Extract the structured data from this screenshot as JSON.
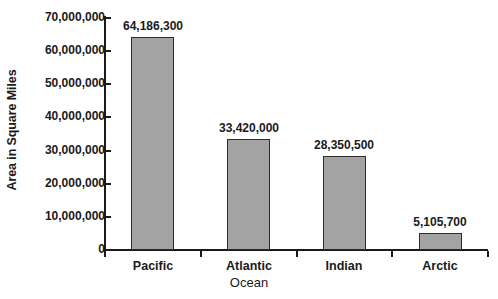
{
  "chart_data": {
    "type": "bar",
    "title": "",
    "xlabel": "Ocean",
    "ylabel": "Area in Square Miles",
    "categories": [
      "Pacific",
      "Atlantic",
      "Indian",
      "Arctic"
    ],
    "values": [
      64186300,
      33420000,
      28350500,
      5105700
    ],
    "value_labels": [
      "64,186,300",
      "33,420,000",
      "28,350,500",
      "5,105,700"
    ],
    "ylim": [
      0,
      70000000
    ],
    "ytick_values": [
      0,
      10000000,
      20000000,
      30000000,
      40000000,
      50000000,
      60000000,
      70000000
    ],
    "ytick_labels": [
      "0",
      "10,000,000",
      "20,000,000",
      "30,000,000",
      "40,000,000",
      "50,000,000",
      "60,000,000",
      "70,000,000"
    ],
    "grid": false,
    "legend": null,
    "bar_color": "#a3a3a3",
    "bar_border_color": "#2b2b2b",
    "axis_color": "#1a1a1a",
    "background": "#ffffff"
  }
}
